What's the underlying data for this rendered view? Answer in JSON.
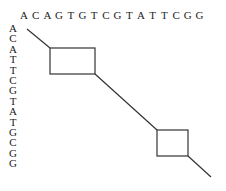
{
  "diagram": {
    "type": "dot-plot alignment",
    "top_sequence": [
      "A",
      "C",
      "A",
      "G",
      "T",
      "G",
      "T",
      "C",
      "G",
      "T",
      "A",
      "T",
      "T",
      "C",
      "G",
      "G"
    ],
    "left_sequence": [
      "A",
      "C",
      "A",
      "T",
      "T",
      "C",
      "G",
      "T",
      "A",
      "T",
      "G",
      "C",
      "G",
      "G"
    ],
    "colors": {
      "text": "#222222",
      "line": "#333333",
      "background": "#ffffff"
    },
    "segments": [
      {
        "x1": 27,
        "y1": 29,
        "x2": 50,
        "y2": 48
      },
      {
        "x1": 95,
        "y1": 74,
        "x2": 157,
        "y2": 130
      },
      {
        "x1": 188,
        "y1": 156,
        "x2": 211,
        "y2": 177
      }
    ],
    "boxes": [
      {
        "x": 50,
        "y": 48,
        "w": 45,
        "h": 26
      },
      {
        "x": 157,
        "y": 130,
        "w": 31,
        "h": 26
      }
    ]
  }
}
